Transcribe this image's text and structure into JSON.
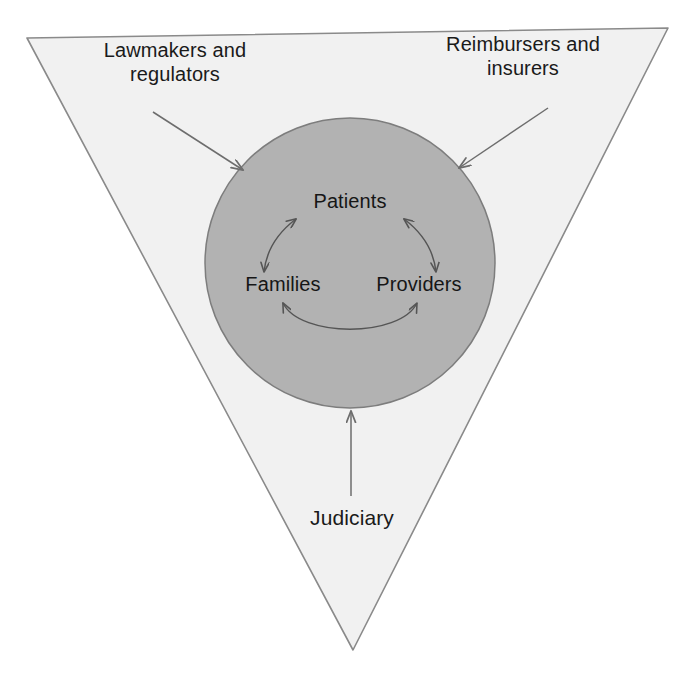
{
  "diagram": {
    "shapes": {
      "triangle": {
        "name": "outer-triangle",
        "fill": "#f1f1f1",
        "stroke": "#8a8a8a",
        "orientation": "inverted",
        "vertices": "27,38 668,28 353,650"
      },
      "circle": {
        "name": "core-circle",
        "fill": "#b2b2b2",
        "stroke": "#7d7d7d",
        "cx": 350,
        "cy": 263,
        "r": 145
      }
    },
    "outer_labels": [
      {
        "id": "lawmakers",
        "text": "Lawmakers and\nregulators",
        "arrow": "down-right-arrow"
      },
      {
        "id": "reimbursers",
        "text": "Reimbursers and\ninsurers",
        "arrow": "down-left-arrow"
      },
      {
        "id": "judiciary",
        "text": "Judiciary",
        "arrow": "up-arrow"
      }
    ],
    "core_labels": [
      {
        "id": "patients",
        "text": "Patients"
      },
      {
        "id": "families",
        "text": "Families"
      },
      {
        "id": "providers",
        "text": "Providers"
      }
    ],
    "core_connections": [
      {
        "id": "patients-families",
        "from": "Patients",
        "to": "Families",
        "style": "double-headed-curved-arrow"
      },
      {
        "id": "patients-providers",
        "from": "Patients",
        "to": "Providers",
        "style": "double-headed-curved-arrow"
      },
      {
        "id": "families-providers",
        "from": "Families",
        "to": "Providers",
        "style": "double-headed-curved-arrow"
      }
    ],
    "colors": {
      "background": "#ffffff",
      "triangle_fill": "#f1f1f1",
      "triangle_stroke": "#8a8a8a",
      "circle_fill": "#b2b2b2",
      "circle_stroke": "#7d7d7d",
      "arrow": "#6d6d6d",
      "core_arrow": "#555555",
      "text": "#1a1a1a"
    }
  }
}
